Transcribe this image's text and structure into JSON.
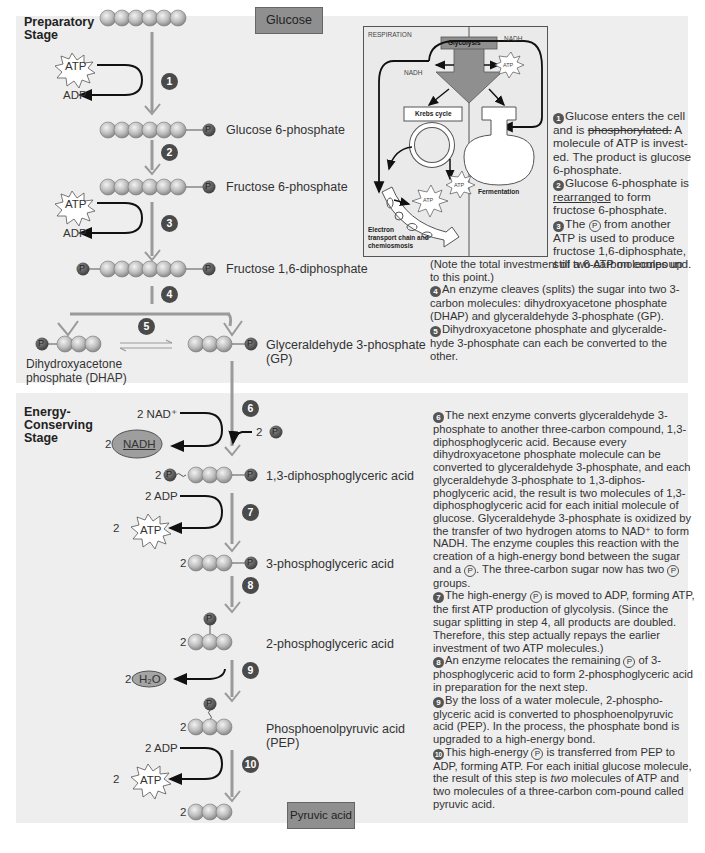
{
  "preparatory": {
    "stage_label_1": "Preparatory",
    "stage_label_2": "Stage",
    "start_box": "Glucose",
    "atp": "ATP",
    "adp": "ADP",
    "steps": [
      "1",
      "2",
      "3",
      "4",
      "5"
    ],
    "molecules": {
      "g6p": "Glucose 6-phosphate",
      "f6p": "Fructose 6-phosphate",
      "f16dp": "Fructose 1,6-diphosphate",
      "gp_1": "Glyceraldehyde 3-phosphate",
      "gp_2": "(GP)",
      "dhap_1": "Dihydroxyacetone",
      "dhap_2": "phosphate (DHAP)"
    },
    "phosphate": "P"
  },
  "respiration_inset": {
    "title": "RESPIRATION",
    "glycolysis": "Glycolysis",
    "nadh_left": "NADH",
    "nadh_right": "NADH",
    "atp": "ATP",
    "krebs": "Krebs cycle",
    "fermentation": "Fermentation",
    "etc_1": "Electron",
    "etc_2": "transport chain and",
    "etc_3": "chemiosmosis"
  },
  "descriptions_top": [
    {
      "num": "1",
      "text_a": "Glucose enters the cell and is ",
      "text_strike": "phosphorylated.",
      "text_b": " A molecule of ATP is invest-ed.  The product is glucose 6-phosphate."
    },
    {
      "num": "2",
      "text_a": "Glucose 6-phosphate is ",
      "text_under": "rearranged",
      "text_b": " to form fructose 6-phosphate."
    },
    {
      "num": "3",
      "text_a": "The ",
      "p": "P",
      "text_b": " from another ATP is used to produce fructose 1,6-diphosphate, still a 6-carbon compound."
    },
    {
      "num": "",
      "text_a": "(Note the total investment of two ATP molecules up to this point.)"
    },
    {
      "num": "4",
      "text_a": "An enzyme cleaves (splits) the sugar into two 3-carbon molecules: dihydroxyacetone phosphate (DHAP) and glyceraldehyde 3-phosphate (GP)."
    },
    {
      "num": "5",
      "text_a": "Dihydroxyacetone phosphate and glyceralde-hyde 3-phosphate can each be converted to the other."
    }
  ],
  "energy": {
    "stage_label_1": "Energy-",
    "stage_label_2": "Conserving",
    "stage_label_3": "Stage",
    "steps": [
      "6",
      "7",
      "8",
      "9",
      "10"
    ],
    "nad": "2 NAD⁺",
    "nadh_coef": "2",
    "nadh": "NADH",
    "two": "2",
    "adp": "2 ADP",
    "atp": "ATP",
    "h2o": "H₂O",
    "end_box": "Pyruvic acid",
    "molecules": {
      "dpga": "1,3-diphosphoglyceric acid",
      "pga3": "3-phosphoglyceric acid",
      "pga2": "2-phosphoglyceric acid",
      "pep_1": "Phosphoenolpyruvic acid",
      "pep_2": "(PEP)"
    }
  },
  "descriptions_bottom": [
    {
      "num": "6",
      "text_a": "The next enzyme converts glyceraldehyde 3-phosphate to another three-carbon compound, 1,3-diphosphoglyceric acid.  Because every dihydroxyacetone phosphate molecule can be converted to glyceraldehyde 3-phosphate, and each glyceraldehyde 3-phosphate to 1,3-diphos-phoglyceric acid, the result is two molecules of 1,3-diphosphoglyceric acid for each initial molecule of glucose.  Glyceraldehyde 3-phosphate is oxidized by the transfer of two hydrogen atoms to NAD⁺ to form NADH.  The enzyme couples this reaction with the creation of a high-energy bond between the sugar and a ",
      "p": "P",
      "text_b": ".  The three-carbon sugar now has two ",
      "p2": "P",
      "text_c": " groups."
    },
    {
      "num": "7",
      "text_a": "The high-energy ",
      "p": "P",
      "text_b": " is moved to ADP, forming ATP, the first ATP production of glycolysis.  (Since the sugar splitting in step 4, all products are doubled.  Therefore, this step actually repays the earlier investment of two ATP molecules.)"
    },
    {
      "num": "8",
      "text_a": "An enzyme relocates the remaining ",
      "p": "P",
      "text_b": " of 3-phosphoglyceric acid to form 2-phosphoglyceric acid in preparation for the next step."
    },
    {
      "num": "9",
      "text_a": "By the loss of a water molecule, 2-phospho-glyceric acid is converted to phosphoenolpyruvic acid (PEP).  In the process, the phosphate bond is upgraded to a high-energy bond."
    },
    {
      "num": "10",
      "text_a": "This high-energy ",
      "p": "P",
      "text_b": " is transferred from PEP to ADP, forming ATP.  For each initial glucose molecule, the result of this step is ",
      "text_em": "two",
      "text_c": " molecules of ATP and two molecules of a three-carbon com-pound called pyruvic acid."
    }
  ],
  "colors": {
    "panel_bg": "#eeeeee",
    "bead": "#bdbdbd",
    "phosphate": "#5a5a5a",
    "step_badge": "#4a4a4a",
    "box": "#8f8f8f",
    "arrow_grey": "#9a9a9a"
  }
}
